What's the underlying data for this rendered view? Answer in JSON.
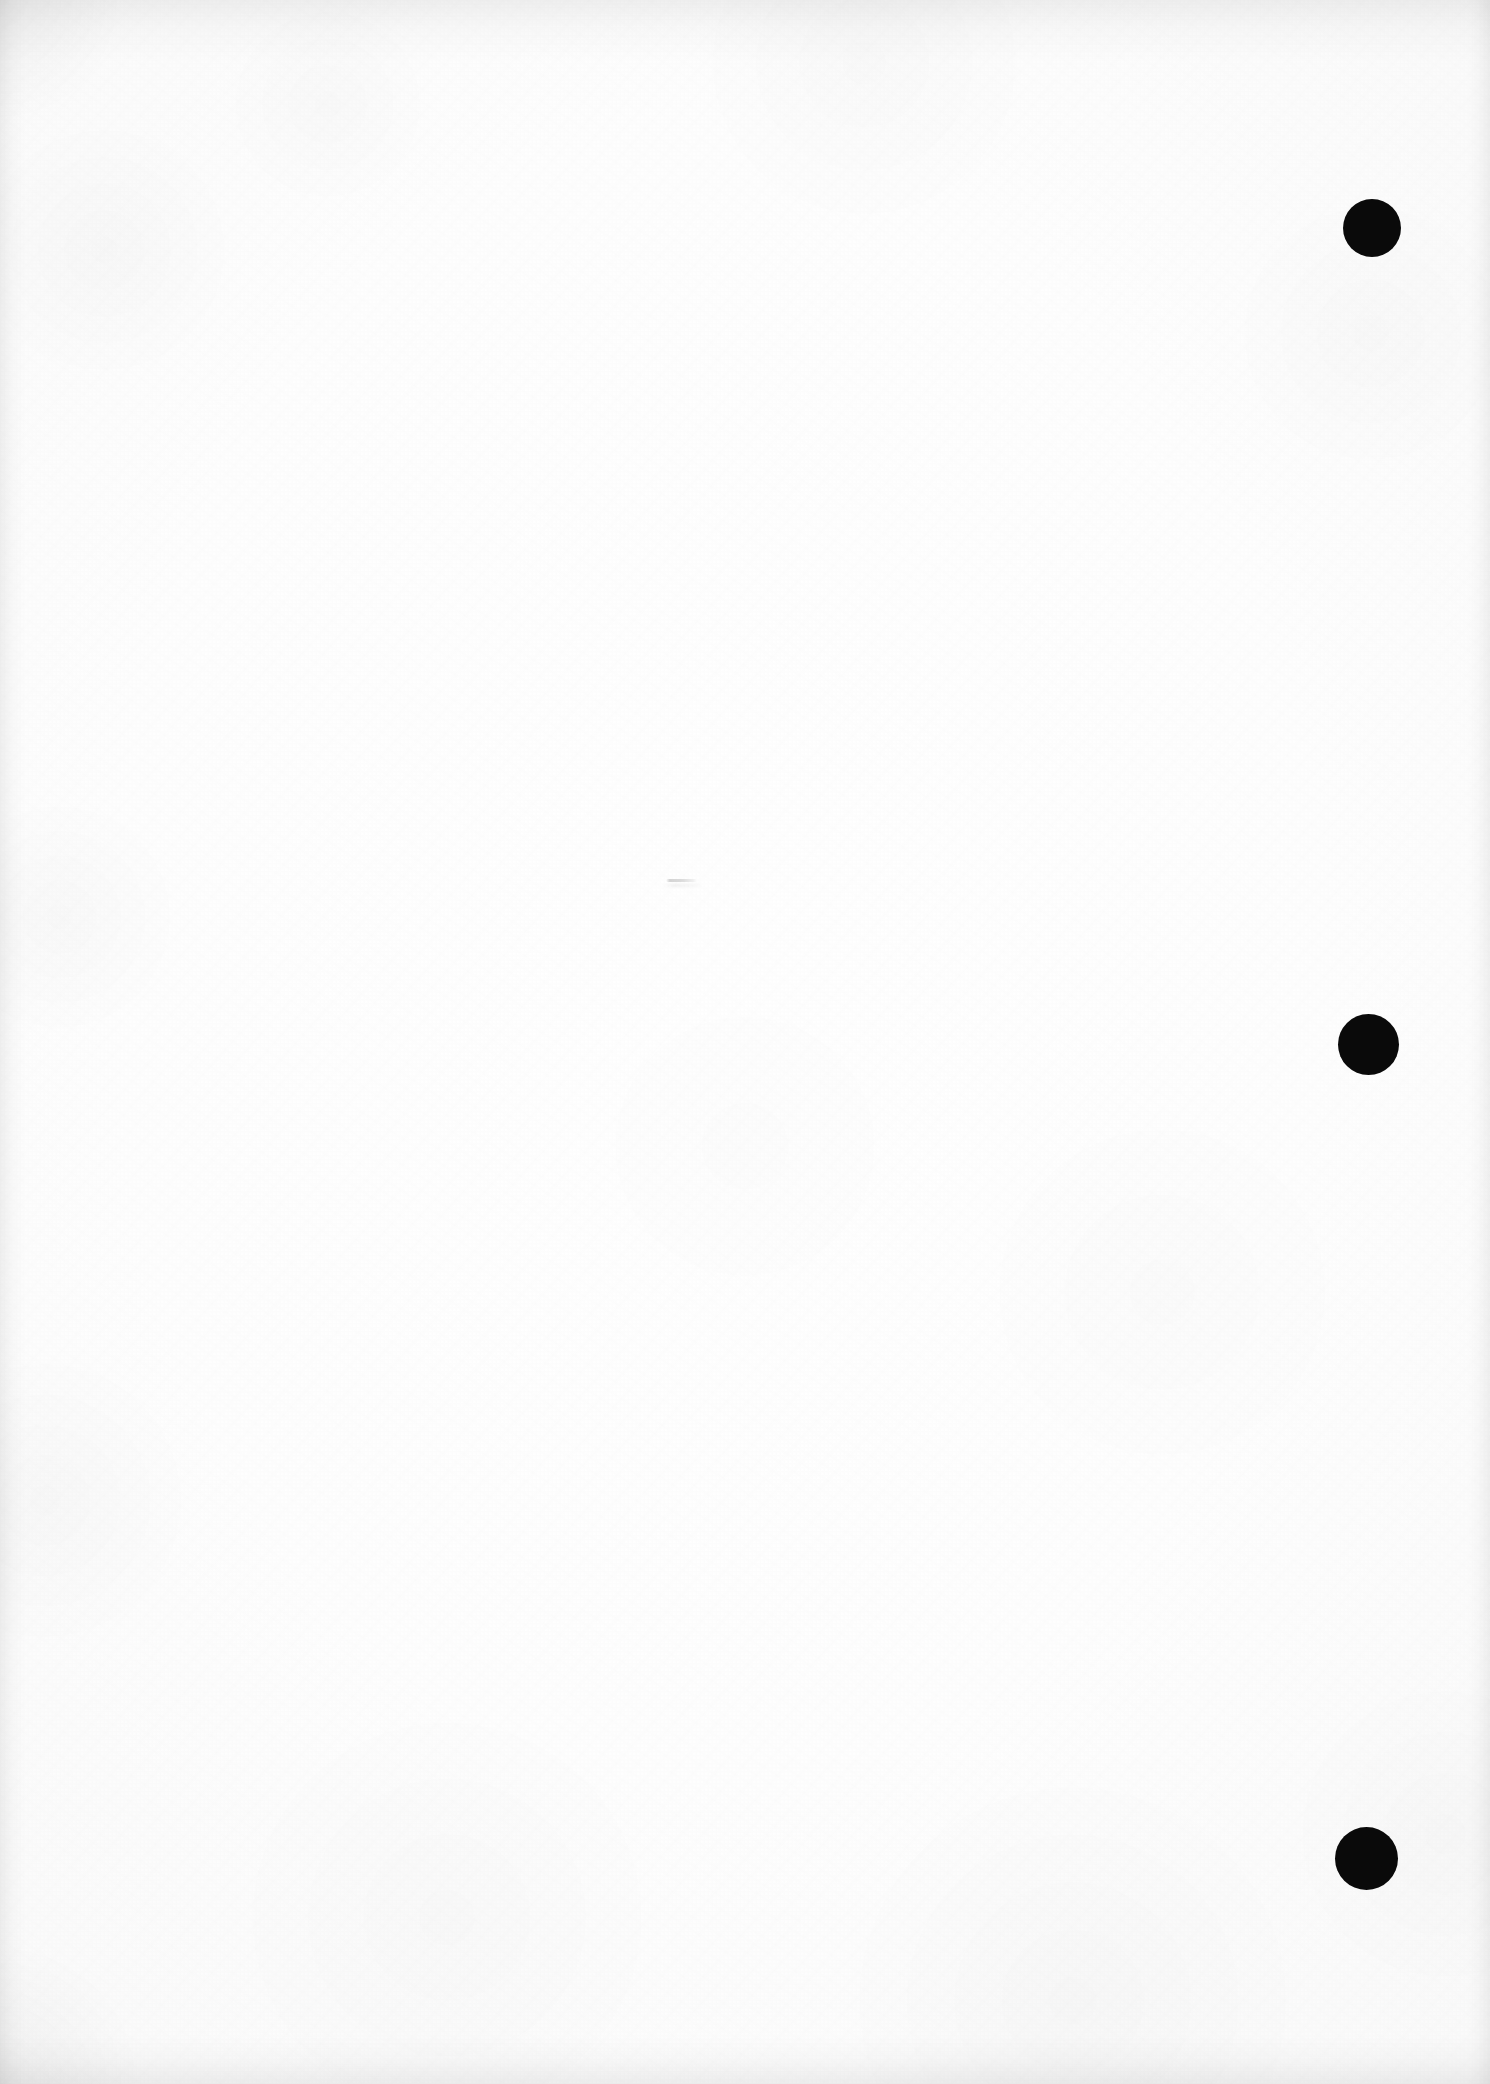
{
  "page": {
    "kind": "scanned-blank-document-page",
    "width": 1490,
    "height": 2084,
    "background_color": "#ffffff",
    "paper_tone": "#fdfdfd",
    "content_text": ""
  },
  "marks": {
    "ink_color": "#0a0a0a",
    "punch_dots": [
      {
        "label": "top-margin-dot",
        "cx": 1372,
        "cy": 228,
        "diameter": 58
      },
      {
        "label": "middle-margin-dot",
        "cx": 1368,
        "cy": 1044,
        "diameter": 61
      },
      {
        "label": "bottom-margin-dot",
        "cx": 1366,
        "cy": 1858,
        "diameter": 63
      }
    ],
    "pencil_smudge": {
      "label": "faint-horizontal-pencil-stroke",
      "x": 666,
      "y": 879,
      "width": 31,
      "height": 3,
      "opacity": "very-faint"
    }
  },
  "edges": {
    "top_shadow": true,
    "left_shadow": true,
    "right_shadow": true,
    "bottom_shadow": true
  }
}
